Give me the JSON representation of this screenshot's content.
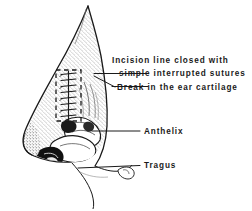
{
  "figure": {
    "background_color": "#ffffff",
    "ink_color": "#1a1a1a",
    "width": 252,
    "height": 211
  },
  "labels": {
    "incision_line_1": "Incision line closed with",
    "incision_line_2": "simple interrupted sutures",
    "break_cartilage": "Break in the ear cartilage",
    "anthelix": "Anthelix",
    "tragus": "Tragus"
  },
  "annotations": {
    "dashed_box_name": "incision-region-dashed-box",
    "suture_count": 8,
    "leader_lines": [
      {
        "name": "leader-sutures",
        "from_x": 95,
        "from_y": 74,
        "to_x": 148,
        "to_y": 74
      },
      {
        "name": "leader-break",
        "from_x": 95,
        "from_y": 76,
        "to_x": 148,
        "to_y": 88
      },
      {
        "name": "leader-anthelix",
        "from_x": 92,
        "from_y": 131,
        "to_x": 140,
        "to_y": 131
      },
      {
        "name": "leader-tragus",
        "from_x": 78,
        "from_y": 168,
        "to_x": 140,
        "to_y": 166
      }
    ]
  }
}
